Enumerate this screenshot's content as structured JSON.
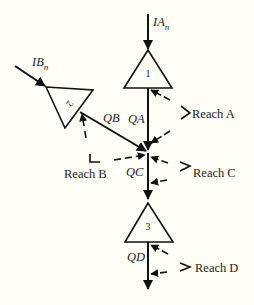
{
  "diagram": {
    "colors": {
      "background": "#fffef6",
      "stroke": "#111111"
    },
    "inflows": [
      {
        "id": "IA",
        "label": "IA",
        "subscript": "n"
      },
      {
        "id": "IB",
        "label": "IB",
        "subscript": "n"
      }
    ],
    "nodes": [
      {
        "id": "1",
        "label": "1",
        "shape": "triangle"
      },
      {
        "id": "2",
        "label": "2",
        "shape": "triangle-rotated"
      },
      {
        "id": "3",
        "label": "3",
        "shape": "triangle"
      }
    ],
    "flows": [
      {
        "id": "QA",
        "label": "QA"
      },
      {
        "id": "QB",
        "label": "QB"
      },
      {
        "id": "QC",
        "label": "QC"
      },
      {
        "id": "QD",
        "label": "QD"
      }
    ],
    "reaches": [
      {
        "id": "A",
        "label": "Reach A"
      },
      {
        "id": "B",
        "label": "Reach B"
      },
      {
        "id": "C",
        "label": "Reach C"
      },
      {
        "id": "D",
        "label": "Reach D"
      }
    ]
  }
}
